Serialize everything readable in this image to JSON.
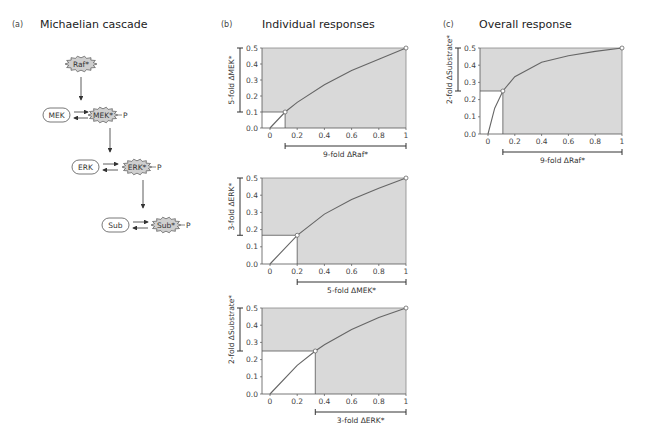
{
  "panels": {
    "a": {
      "label": "(a)",
      "title": "Michaelian cascade"
    },
    "b": {
      "label": "(b)",
      "title": "Individual responses"
    },
    "c": {
      "label": "(c)",
      "title": "Overall response"
    }
  },
  "diagram": {
    "nodes": [
      {
        "id": "raf_active",
        "label": "Raf*",
        "shape": "star"
      },
      {
        "id": "mek",
        "label": "MEK",
        "shape": "pill"
      },
      {
        "id": "mek_active",
        "label": "MEK*",
        "shape": "star",
        "phospho": "P"
      },
      {
        "id": "erk",
        "label": "ERK",
        "shape": "pill"
      },
      {
        "id": "erk_active",
        "label": "ERK*",
        "shape": "star",
        "phospho": "P"
      },
      {
        "id": "sub",
        "label": "Sub",
        "shape": "pill"
      },
      {
        "id": "sub_active",
        "label": "Sub*",
        "shape": "star",
        "phospho": "P"
      }
    ]
  },
  "colors": {
    "shade": "#d9d9d9",
    "curve": "#666666",
    "frame": "#888888",
    "star_fill": "#cfcfcf"
  },
  "chart_data": [
    {
      "type": "line",
      "panel": "b-1",
      "title": "",
      "xlabel": "9-fold ΔRaf*",
      "ylabel": "5-fold ΔMEK*",
      "xlim": [
        0,
        1
      ],
      "ylim": [
        0,
        0.5
      ],
      "xticks": [
        "0",
        "0.2",
        "0.4",
        "0.6",
        "0.8",
        "1"
      ],
      "yticks": [
        "0.0",
        "0.1",
        "0.2",
        "0.3",
        "0.4",
        "0.5"
      ],
      "x": [
        0,
        0.111,
        0.2,
        0.4,
        0.6,
        0.8,
        1.0
      ],
      "y": [
        0,
        0.1,
        0.16,
        0.27,
        0.36,
        0.43,
        0.5
      ],
      "marked_points": [
        [
          0.111,
          0.1
        ],
        [
          1.0,
          0.5
        ]
      ]
    },
    {
      "type": "line",
      "panel": "b-2",
      "xlabel": "5-fold ΔMEK*",
      "ylabel": "3-fold ΔERK*",
      "xlim": [
        0,
        1
      ],
      "ylim": [
        0,
        0.5
      ],
      "xticks": [
        "0",
        "0.2",
        "0.4",
        "0.6",
        "0.8",
        "1"
      ],
      "yticks": [
        "0.0",
        "0.1",
        "0.2",
        "0.3",
        "0.4",
        "0.5"
      ],
      "x": [
        0,
        0.2,
        0.4,
        0.6,
        0.8,
        1.0
      ],
      "y": [
        0,
        0.167,
        0.29,
        0.375,
        0.44,
        0.5
      ],
      "marked_points": [
        [
          0.2,
          0.167
        ],
        [
          1.0,
          0.5
        ]
      ]
    },
    {
      "type": "line",
      "panel": "b-3",
      "xlabel": "3-fold ΔERK*",
      "ylabel": "2-fold ΔSubstrate*",
      "xlim": [
        0,
        1
      ],
      "ylim": [
        0,
        0.5
      ],
      "xticks": [
        "0",
        "0.2",
        "0.4",
        "0.6",
        "0.8",
        "1"
      ],
      "yticks": [
        "0.0",
        "0.1",
        "0.2",
        "0.3",
        "0.4",
        "0.5"
      ],
      "x": [
        0,
        0.2,
        0.333,
        0.4,
        0.6,
        0.8,
        1.0
      ],
      "y": [
        0,
        0.167,
        0.25,
        0.286,
        0.375,
        0.444,
        0.5
      ],
      "marked_points": [
        [
          0.333,
          0.25
        ],
        [
          1.0,
          0.5
        ]
      ]
    },
    {
      "type": "line",
      "panel": "c",
      "xlabel": "9-fold ΔRaf*",
      "ylabel": "2-fold ΔSubstrate*",
      "xlim": [
        0,
        1
      ],
      "ylim": [
        0,
        0.5
      ],
      "xticks": [
        "0",
        "0.2",
        "0.4",
        "0.6",
        "0.8",
        "1"
      ],
      "yticks": [
        "0.0",
        "0.1",
        "0.2",
        "0.3",
        "0.4",
        "0.5"
      ],
      "x": [
        0,
        0.05,
        0.111,
        0.2,
        0.4,
        0.6,
        0.8,
        1.0
      ],
      "y": [
        0,
        0.15,
        0.25,
        0.333,
        0.417,
        0.455,
        0.48,
        0.5
      ],
      "marked_points": [
        [
          0.111,
          0.25
        ],
        [
          1.0,
          0.5
        ]
      ]
    }
  ]
}
